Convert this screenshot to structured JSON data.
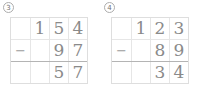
{
  "page": {
    "kind": "subtraction-worksheet",
    "background_color": "#ffffff",
    "grid_line_color": "#e6e6e6",
    "rule_line_color": "#b4b4b4",
    "digit_color": "#8a8a8a"
  },
  "problems": [
    {
      "number_label": "3",
      "operator": "−",
      "minuend": "154",
      "subtrahend": "97",
      "answer": "57",
      "rows": [
        {
          "name": "minuend-row",
          "cells": [
            "",
            "1",
            "5",
            "4"
          ]
        },
        {
          "name": "subtrahend-row",
          "cells": [
            "−",
            "",
            "9",
            "7"
          ]
        },
        {
          "name": "answer-row",
          "cells": [
            "",
            "",
            "5",
            "7"
          ]
        }
      ]
    },
    {
      "number_label": "4",
      "operator": "−",
      "minuend": "123",
      "subtrahend": "89",
      "answer": "34",
      "rows": [
        {
          "name": "minuend-row",
          "cells": [
            "",
            "1",
            "2",
            "3"
          ]
        },
        {
          "name": "subtrahend-row",
          "cells": [
            "−",
            "",
            "8",
            "9"
          ]
        },
        {
          "name": "answer-row",
          "cells": [
            "",
            "",
            "3",
            "4"
          ]
        }
      ]
    }
  ]
}
